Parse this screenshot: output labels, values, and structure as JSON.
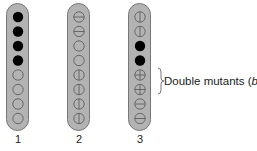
{
  "columns": [
    {
      "label": "1",
      "x": 6,
      "cells": [
        "filled",
        "filled",
        "filled",
        "filled",
        "empty",
        "empty",
        "empty",
        "empty"
      ]
    },
    {
      "label": "2",
      "x": 67,
      "cells": [
        "hline",
        "hline",
        "empty",
        "empty",
        "vline",
        "vline",
        "vline",
        "vline"
      ]
    },
    {
      "label": "3",
      "x": 128,
      "cells": [
        "vline",
        "vline",
        "filled",
        "filled",
        "cross",
        "cross",
        "hline",
        "hline"
      ]
    }
  ],
  "annotation": {
    "text": "Double mutants (",
    "italic": "bf",
    "close": ")",
    "brace_rows": [
      4,
      5
    ]
  },
  "colors": {
    "pill_fill": "#b3b3b3",
    "pill_border": "#777777",
    "filled": "#000000",
    "stroke": "#555555"
  }
}
